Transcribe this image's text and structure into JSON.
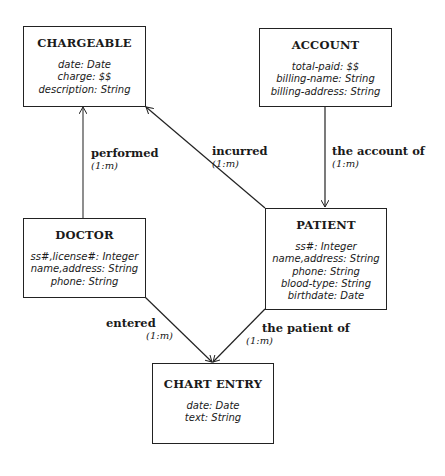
{
  "entities": {
    "chargeable": {
      "title": "CHARGEABLE",
      "attributes": [
        "date: Date",
        "charge: $$",
        "description: String"
      ]
    },
    "account": {
      "title": "ACCOUNT",
      "attributes": [
        "total-paid: $$",
        "billing-name: String",
        "billing-address: String"
      ]
    },
    "doctor": {
      "title": "DOCTOR",
      "attributes": [
        "ss#,license#: Integer",
        "name,address: String",
        "phone: String"
      ]
    },
    "patient": {
      "title": "PATIENT",
      "attributes": [
        "ss#: Integer",
        "name,address: String",
        "phone: String",
        "blood-type: String",
        "birthdate: Date"
      ]
    },
    "chart_entry": {
      "title": "CHART ENTRY",
      "attributes": [
        "date: Date",
        "text: String"
      ]
    }
  },
  "relationships": {
    "performed": {
      "label": "performed",
      "cardinality": "(1:m)"
    },
    "incurred": {
      "label": "incurred",
      "cardinality": "(1:m)"
    },
    "account_of": {
      "label": "the account of",
      "cardinality": "(1:m)"
    },
    "entered": {
      "label": "entered",
      "cardinality": "(1:m)"
    },
    "patient_of": {
      "label": "the patient of",
      "cardinality": "(1:m)"
    }
  }
}
